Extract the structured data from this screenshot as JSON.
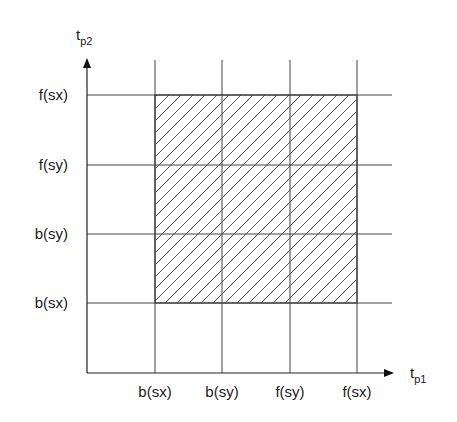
{
  "axes": {
    "x_label": "t",
    "x_sub": "p1",
    "y_label": "t",
    "y_sub": "p2"
  },
  "x_ticks": [
    "b(sx)",
    "b(sy)",
    "f(sy)",
    "f(sx)"
  ],
  "y_ticks": [
    "b(sx)",
    "b(sy)",
    "f(sy)",
    "f(sx)"
  ],
  "region": {
    "description": "hatched rectangle",
    "x_range": [
      "b(sx)",
      "f(sx)"
    ],
    "y_range": [
      "b(sx)",
      "f(sx)"
    ]
  },
  "colors": {
    "line": "#333333",
    "hatch": "#555555"
  }
}
